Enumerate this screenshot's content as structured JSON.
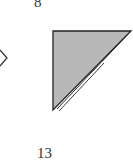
{
  "labels": {
    "top": "8",
    "bottom": "13"
  },
  "shapes": {
    "arrow": {
      "glyph": "chevron-right",
      "color": "#333333"
    },
    "triangle": {
      "type": "right-triangle",
      "fill": "#b8b8b8",
      "stroke": "#222222",
      "vertices": [
        [
          53,
          31
        ],
        [
          131,
          31
        ],
        [
          53,
          110
        ]
      ],
      "hypotenuse": "double-line"
    }
  },
  "colors": {
    "background": "#ffffff",
    "fill": "#b8b8b8",
    "stroke": "#222222"
  }
}
